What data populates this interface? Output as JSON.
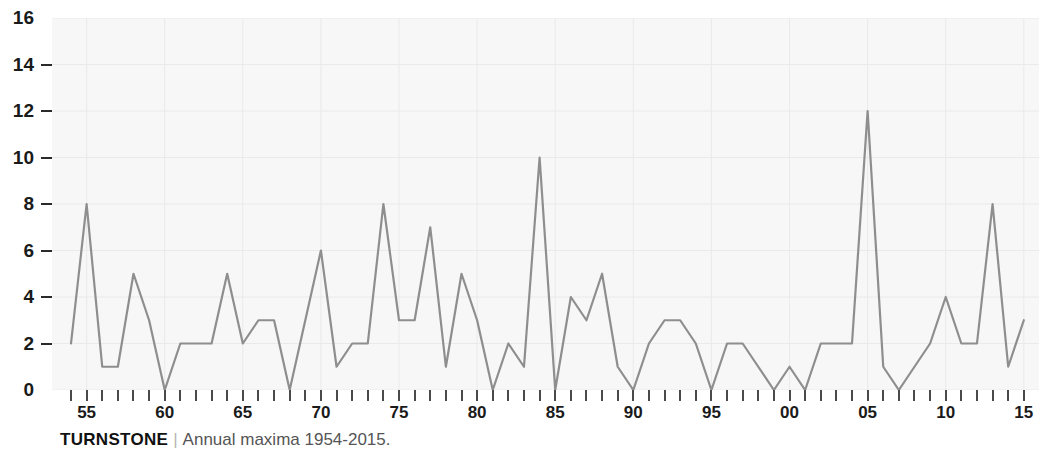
{
  "caption": {
    "title": "TURNSTONE",
    "separator": "|",
    "subtitle": "Annual maxima 1954-2015."
  },
  "colors": {
    "line": "#8e8e8e",
    "plot_background": "#f7f7f7",
    "grid": "#eaeaea",
    "tick": "#4a4a4a",
    "text": "#1a1a1a",
    "caption_subtitle": "#555555"
  },
  "chart_data": {
    "type": "line",
    "title": "TURNSTONE",
    "subtitle": "Annual maxima 1954-2015.",
    "xlabel": "",
    "ylabel": "",
    "ylim": [
      0,
      16
    ],
    "xlim": [
      1954,
      2015
    ],
    "grid": true,
    "legend": "none",
    "y_ticks": [
      0,
      2,
      4,
      6,
      8,
      10,
      12,
      14,
      16
    ],
    "y_tick_labels": [
      "0",
      "2",
      "4",
      "6",
      "8",
      "10",
      "12",
      "14",
      "16"
    ],
    "x_tick_years": [
      1954,
      1955,
      1956,
      1957,
      1958,
      1959,
      1960,
      1961,
      1962,
      1963,
      1964,
      1965,
      1966,
      1967,
      1968,
      1969,
      1970,
      1971,
      1972,
      1973,
      1974,
      1975,
      1976,
      1977,
      1978,
      1979,
      1980,
      1981,
      1982,
      1983,
      1984,
      1985,
      1986,
      1987,
      1988,
      1989,
      1990,
      1991,
      1992,
      1993,
      1994,
      1995,
      1996,
      1997,
      1998,
      1999,
      2000,
      2001,
      2002,
      2003,
      2004,
      2005,
      2006,
      2007,
      2008,
      2009,
      2010,
      2011,
      2012,
      2013,
      2014,
      2015
    ],
    "x_labeled_years": [
      1955,
      1960,
      1965,
      1970,
      1975,
      1980,
      1985,
      1990,
      1995,
      2000,
      2005,
      2010,
      2015
    ],
    "x_tick_labels": [
      "55",
      "60",
      "65",
      "70",
      "75",
      "80",
      "85",
      "90",
      "95",
      "00",
      "05",
      "10",
      "15"
    ],
    "x": [
      1954,
      1955,
      1956,
      1957,
      1958,
      1959,
      1960,
      1961,
      1962,
      1963,
      1964,
      1965,
      1966,
      1967,
      1968,
      1969,
      1970,
      1971,
      1972,
      1973,
      1974,
      1975,
      1976,
      1977,
      1978,
      1979,
      1980,
      1981,
      1982,
      1983,
      1984,
      1985,
      1986,
      1987,
      1988,
      1989,
      1990,
      1991,
      1992,
      1993,
      1994,
      1995,
      1996,
      1997,
      1998,
      1999,
      2000,
      2001,
      2002,
      2003,
      2004,
      2005,
      2006,
      2007,
      2008,
      2009,
      2010,
      2011,
      2012,
      2013,
      2014,
      2015
    ],
    "values": [
      2,
      8,
      1,
      1,
      5,
      3,
      0,
      2,
      2,
      2,
      5,
      2,
      3,
      3,
      0,
      3,
      6,
      1,
      2,
      2,
      8,
      3,
      3,
      7,
      1,
      5,
      3,
      0,
      2,
      1,
      10,
      0,
      4,
      3,
      5,
      1,
      0,
      2,
      3,
      3,
      2,
      0,
      2,
      2,
      1,
      0,
      1,
      0,
      2,
      2,
      2,
      12,
      1,
      0,
      1,
      2,
      4,
      2,
      2,
      8,
      1,
      3
    ],
    "series": [
      {
        "name": "Turnstone annual maxima",
        "values": [
          2,
          8,
          1,
          1,
          5,
          3,
          0,
          2,
          2,
          2,
          5,
          2,
          3,
          3,
          0,
          3,
          6,
          1,
          2,
          2,
          8,
          3,
          3,
          7,
          1,
          5,
          3,
          0,
          2,
          1,
          10,
          0,
          4,
          3,
          5,
          1,
          0,
          2,
          3,
          3,
          2,
          0,
          2,
          2,
          1,
          0,
          1,
          0,
          2,
          2,
          2,
          12,
          1,
          0,
          1,
          2,
          4,
          2,
          2,
          8,
          1,
          3
        ]
      }
    ]
  }
}
